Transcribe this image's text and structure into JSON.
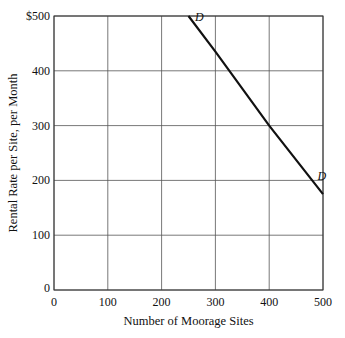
{
  "chart_data": {
    "type": "line",
    "title": "",
    "xlabel": "Number of Moorage Sites",
    "ylabel": "Rental Rate per Site, per Month",
    "xlim": [
      0,
      500
    ],
    "ylim": [
      0,
      500
    ],
    "x_ticks": [
      "0",
      "100",
      "200",
      "300",
      "400",
      "500"
    ],
    "y_ticks": [
      "0",
      "100",
      "200",
      "300",
      "400",
      "$500"
    ],
    "grid": true,
    "series": [
      {
        "name": "D",
        "x": [
          250,
          300,
          400,
          500
        ],
        "y": [
          500,
          435,
          300,
          175
        ]
      }
    ],
    "annotations": [
      {
        "text": "D",
        "x": 262,
        "y": 490
      },
      {
        "text": "D",
        "x": 490,
        "y": 200
      }
    ]
  }
}
